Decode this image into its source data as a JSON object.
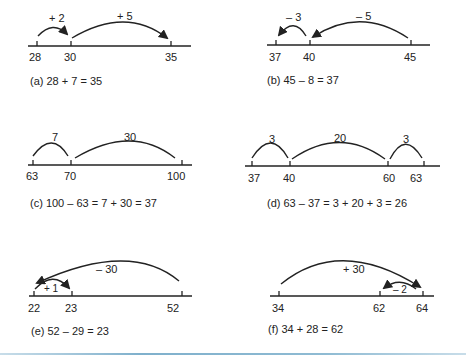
{
  "figure": {
    "panels": [
      {
        "id": "a",
        "caption": "(a) 28 + 7 = 35",
        "ticks": [
          {
            "value": "28"
          },
          {
            "value": "30"
          },
          {
            "value": "35"
          }
        ],
        "jumps": [
          {
            "label": "+ 2",
            "from": "28",
            "to": "30"
          },
          {
            "label": "+ 5",
            "from": "30",
            "to": "35"
          }
        ]
      },
      {
        "id": "b",
        "caption": "(b) 45 – 8 = 37",
        "ticks": [
          {
            "value": "37"
          },
          {
            "value": "40"
          },
          {
            "value": "45"
          }
        ],
        "jumps": [
          {
            "label": "– 3",
            "from": "40",
            "to": "37"
          },
          {
            "label": "– 5",
            "from": "45",
            "to": "40"
          }
        ]
      },
      {
        "id": "c",
        "caption": "(c) 100 – 63 = 7 + 30 = 37",
        "ticks": [
          {
            "value": "63"
          },
          {
            "value": "70"
          },
          {
            "value": "100"
          }
        ],
        "jumps": [
          {
            "label": "7",
            "from": "63",
            "to": "70"
          },
          {
            "label": "30",
            "from": "70",
            "to": "100"
          }
        ]
      },
      {
        "id": "d",
        "caption": "(d) 63 – 37 = 3 + 20 + 3 = 26",
        "ticks": [
          {
            "value": "37"
          },
          {
            "value": "40"
          },
          {
            "value": "60"
          },
          {
            "value": "63"
          }
        ],
        "jumps": [
          {
            "label": "3",
            "from": "37",
            "to": "40"
          },
          {
            "label": "20",
            "from": "40",
            "to": "60"
          },
          {
            "label": "3",
            "from": "60",
            "to": "63"
          }
        ]
      },
      {
        "id": "e",
        "caption": "(e) 52 – 29 = 23",
        "ticks": [
          {
            "value": "22"
          },
          {
            "value": "23"
          },
          {
            "value": "52"
          }
        ],
        "jumps": [
          {
            "label": "– 30",
            "from": "52",
            "to": "22"
          },
          {
            "label": "+ 1",
            "from": "22",
            "to": "23"
          }
        ]
      },
      {
        "id": "f",
        "caption": "(f) 34 + 28 = 62",
        "ticks": [
          {
            "value": "34"
          },
          {
            "value": "62"
          },
          {
            "value": "64"
          }
        ],
        "jumps": [
          {
            "label": "+ 30",
            "from": "34",
            "to": "64"
          },
          {
            "label": "– 2",
            "from": "64",
            "to": "62"
          }
        ]
      }
    ],
    "colors": {
      "ink": "#222222",
      "rule": "#7fb0cc"
    }
  }
}
